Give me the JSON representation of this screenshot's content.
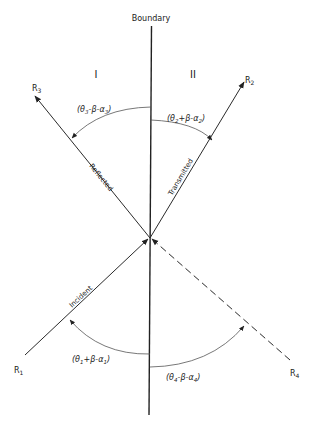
{
  "title": "Boundary",
  "regions": {
    "left": "I",
    "right": "II"
  },
  "rays": {
    "incident": {
      "label": "Incident",
      "end_label": "R",
      "end_sub": "1"
    },
    "transmitted": {
      "label": "Transmitted",
      "end_label": "R",
      "end_sub": "2"
    },
    "reflected": {
      "label": "Reflected",
      "end_label": "R",
      "end_sub": "3"
    },
    "fourth": {
      "label": "",
      "end_label": "R",
      "end_sub": "4"
    }
  },
  "angles": {
    "a1": {
      "open": "(θ",
      "s1": "1",
      "mid": "+β-α",
      "s2": "1",
      "close": ")"
    },
    "a2": {
      "open": "(θ",
      "s1": "2",
      "mid": "+β-α",
      "s2": "2",
      "close": ")"
    },
    "a3": {
      "open": "(θ",
      "s1": "3",
      "mid": "-β-α",
      "s2": "3",
      "close": ")"
    },
    "a4": {
      "open": "(θ",
      "s1": "4",
      "mid": "-β-α",
      "s2": "4",
      "close": ")"
    }
  },
  "colors": {
    "line": "#2a2a2a",
    "arc": "#555555",
    "background": "#ffffff"
  }
}
